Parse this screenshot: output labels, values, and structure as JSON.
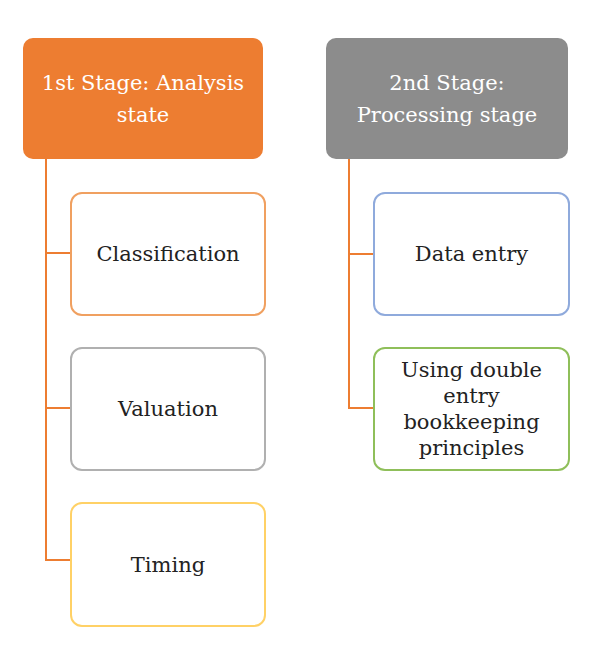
{
  "colors": {
    "connector": "#ed7d31",
    "stage1_fill": "#ed7d31",
    "stage2_fill": "#8c8c8c"
  },
  "stages": [
    {
      "title": "1st Stage: Analysis state",
      "children": [
        {
          "label": "Classification",
          "border": "#f0a060"
        },
        {
          "label": "Valuation",
          "border": "#b0b0b0"
        },
        {
          "label": "Timing",
          "border": "#ffd166"
        }
      ]
    },
    {
      "title": "2nd Stage: Processing stage",
      "children": [
        {
          "label": "Data entry",
          "border": "#8faadc"
        },
        {
          "label": "Using double entry bookkeeping principles",
          "border": "#8fbf5a"
        }
      ]
    }
  ]
}
